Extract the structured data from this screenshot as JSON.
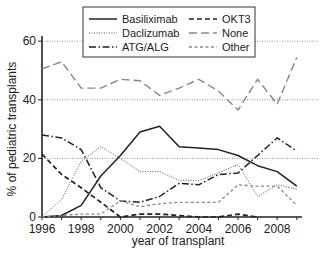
{
  "chart_data": {
    "type": "line",
    "title": "",
    "xlabel": "year of transplant",
    "ylabel": "% of pediatric transplants",
    "xlim": [
      1996,
      2009
    ],
    "ylim": [
      0,
      62
    ],
    "x": [
      1996,
      1997,
      1998,
      1999,
      2000,
      2001,
      2002,
      2003,
      2004,
      2005,
      2006,
      2007,
      2008,
      2009
    ],
    "x_ticks": [
      1996,
      1998,
      2000,
      2002,
      2004,
      2006,
      2008
    ],
    "y_ticks": [
      0,
      20,
      40,
      60
    ],
    "gridlines": [
      20,
      40,
      60
    ],
    "legend_position": "top-center",
    "series": [
      {
        "name": "Basiliximab",
        "style": "solid",
        "color": "#222222",
        "values": [
          0,
          0.5,
          4,
          14,
          21,
          29,
          31,
          24,
          23.5,
          23,
          21,
          17.5,
          15.5,
          10.5
        ]
      },
      {
        "name": "Daclizumab",
        "style": "dotted",
        "color": "#555555",
        "values": [
          0,
          6,
          19,
          24,
          20,
          15.5,
          15.5,
          12.5,
          12.5,
          15,
          18,
          7,
          11,
          9.5
        ]
      },
      {
        "name": "ATG/ALG",
        "style": "dashdot",
        "color": "#222222",
        "values": [
          28,
          27,
          23,
          10,
          5.5,
          5,
          7,
          11.5,
          11,
          14.5,
          15,
          21,
          27,
          22.5
        ]
      },
      {
        "name": "OKT3",
        "style": "dashed",
        "color": "#222222",
        "values": [
          21.5,
          14.5,
          10,
          5,
          0,
          1,
          1,
          0.5,
          0,
          0,
          1,
          0,
          null,
          null
        ]
      },
      {
        "name": "None",
        "style": "longdash",
        "color": "#888888",
        "values": [
          50.5,
          53,
          44,
          44,
          47,
          46.5,
          41.5,
          44,
          47,
          43,
          36.5,
          47,
          38.5,
          54.5
        ]
      },
      {
        "name": "Other",
        "style": "shortdash",
        "color": "#888888",
        "values": [
          0,
          0.5,
          1,
          1,
          5.5,
          3.5,
          4.5,
          5,
          5,
          5,
          11,
          10.5,
          10.5,
          4
        ]
      }
    ]
  }
}
